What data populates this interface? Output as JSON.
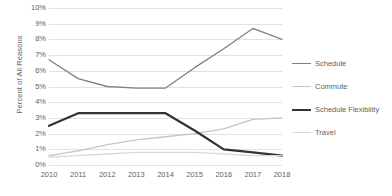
{
  "chart_data": {
    "type": "line",
    "title": "",
    "xlabel": "",
    "ylabel": "Percent of All Reasons",
    "x": [
      "2010",
      "2011",
      "2012",
      "2013",
      "2014",
      "2015",
      "2016",
      "2017",
      "2018"
    ],
    "ylim": [
      0,
      10
    ],
    "ytick_labels": [
      "0%",
      "1%",
      "2%",
      "3%",
      "4%",
      "5%",
      "6%",
      "7%",
      "8%",
      "9%",
      "10%"
    ],
    "ytick_values": [
      0,
      1,
      2,
      3,
      4,
      5,
      6,
      7,
      8,
      9,
      10
    ],
    "grid": true,
    "legend_position": "right",
    "series": [
      {
        "name": "Schedule",
        "color": "#808080",
        "width": 1.3,
        "values": [
          6.7,
          5.5,
          5.0,
          4.9,
          4.9,
          6.2,
          7.4,
          8.7,
          8.0
        ]
      },
      {
        "name": "Commute",
        "color": "#c4c4c4",
        "width": 1.3,
        "values": [
          0.6,
          0.9,
          1.3,
          1.6,
          1.8,
          2.0,
          2.3,
          2.9,
          3.0
        ]
      },
      {
        "name": "Schedule Flexibility",
        "color": "#333333",
        "width": 2.2,
        "values": [
          2.5,
          3.3,
          3.3,
          3.3,
          3.3,
          2.2,
          1.0,
          0.8,
          0.6
        ]
      },
      {
        "name": "Travel",
        "color": "#d9d9d9",
        "width": 1.3,
        "values": [
          0.5,
          0.6,
          0.7,
          0.8,
          0.8,
          0.8,
          0.7,
          0.6,
          0.6
        ]
      }
    ]
  }
}
